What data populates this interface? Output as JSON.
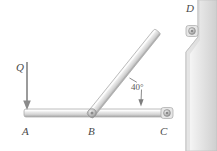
{
  "figure": {
    "kind": "statics-frame-diagram",
    "background_color": "#ffffff"
  },
  "labels": {
    "point_a": "A",
    "point_b": "B",
    "point_c": "C",
    "point_d": "D",
    "load_q": "Q",
    "angle": "40°"
  },
  "geometry": {
    "points": {
      "a": {
        "x": 26,
        "y": 113
      },
      "b": {
        "x": 92,
        "y": 113
      },
      "c": {
        "x": 167,
        "y": 113
      },
      "d": {
        "x": 192,
        "y": 31
      }
    },
    "beam_thickness_horizontal": 8,
    "beam_thickness_diagonal": 8,
    "strut_angle_degrees": 40,
    "load_arrow": {
      "x": 27,
      "y_start": 62,
      "y_end": 110,
      "direction": "down"
    },
    "angle_arc": {
      "vertex_x": 92,
      "vertex_y": 113,
      "radius": 48,
      "start_degrees": 0,
      "end_degrees": 40
    },
    "wall": {
      "top_left_x": 198,
      "top_right_x": 217,
      "step_y_top": 37,
      "step_y_bottom": 52,
      "lower_left_x": 186,
      "bottom_y": 151
    }
  },
  "colors": {
    "beam_light": "#f2f2f2",
    "beam_mid": "#d8d8d8",
    "beam_dark": "#b4b4b4",
    "beam_outline": "#9a9a9a",
    "wall_light": "#ededed",
    "wall_mid": "#dcdcdc",
    "wall_shadow": "#c6c6c6",
    "pin_outer": "#bdbdbd",
    "pin_inner": "#8f8f8f",
    "arrow": "#8a8a8a",
    "text": "#4a4a4a",
    "leader": "#7d7d7d"
  },
  "icons": {
    "pin_joint": "pin-joint-icon",
    "force_arrow": "down-arrow-icon",
    "angle_arc_arrow": "angle-arc-arrow-icon"
  }
}
